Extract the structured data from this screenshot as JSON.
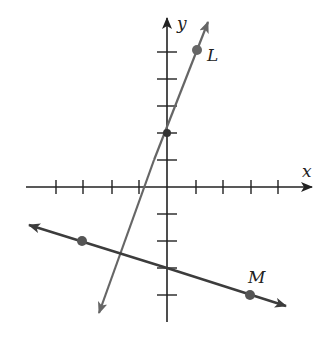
{
  "diagram": {
    "type": "coordinate-plane",
    "axes": {
      "x_label": "x",
      "y_label": "y",
      "color": "#222222",
      "x_ticks": [
        -4,
        -3,
        -2,
        -1,
        1,
        2,
        3,
        4
      ],
      "y_ticks": [
        -4,
        -3,
        -2,
        -1,
        1,
        2,
        3,
        4,
        5
      ]
    },
    "lines": [
      {
        "label": "L",
        "color": "#666666",
        "slope": 3,
        "y_intercept": 2,
        "marked_points": [
          [
            0,
            2
          ],
          [
            1,
            5
          ]
        ]
      },
      {
        "label": "M",
        "color": "#3c3c3c",
        "slope": -0.3333,
        "y_intercept": -3,
        "marked_points": [
          [
            -3,
            -2
          ],
          [
            0,
            -3
          ],
          [
            3,
            -4
          ]
        ]
      }
    ],
    "point_color": "#555555"
  }
}
